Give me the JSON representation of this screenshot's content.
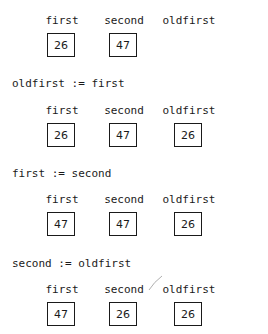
{
  "columns": [
    "first",
    "second",
    "oldfirst"
  ],
  "steps": [
    {
      "statement": "",
      "labels": [
        "first",
        "second",
        "oldfirst"
      ],
      "values": [
        "26",
        "47",
        ""
      ]
    },
    {
      "statement": "oldfirst := first",
      "labels": [
        "first",
        "second",
        "oldfirst"
      ],
      "values": [
        "26",
        "47",
        "26"
      ]
    },
    {
      "statement": "first := second",
      "labels": [
        "first",
        "second",
        "oldfirst"
      ],
      "values": [
        "47",
        "47",
        "26"
      ]
    },
    {
      "statement": "second := oldfirst",
      "labels": [
        "first",
        "second",
        "oldfirst"
      ],
      "values": [
        "47",
        "26",
        "26"
      ]
    }
  ]
}
